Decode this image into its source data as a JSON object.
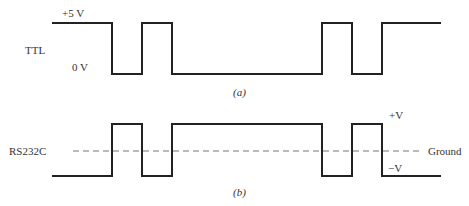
{
  "figure": {
    "panel_a": {
      "signal_label": "TTL",
      "high_label": "+5 V",
      "low_label": "0 V",
      "caption": "(a)",
      "levels": {
        "high_y": 23,
        "low_y": 74
      },
      "transitions_x": [
        52,
        112,
        142,
        172,
        322,
        352,
        382,
        441
      ],
      "start_level": "high"
    },
    "panel_b": {
      "signal_label": "RS232C",
      "high_label": "+V",
      "low_label": "−V",
      "ground_label": "Ground",
      "caption": "(b)",
      "levels": {
        "high_y": 124,
        "low_y": 176,
        "ground_y": 151
      },
      "transitions_x": [
        52,
        112,
        142,
        172,
        322,
        352,
        382,
        441
      ],
      "start_level": "low",
      "ground_line": {
        "x_start": 73,
        "x_end": 422,
        "style": "dashed"
      }
    },
    "colors": {
      "waveform": "#222222",
      "ground_line": "#777777",
      "text": "#333333"
    }
  }
}
